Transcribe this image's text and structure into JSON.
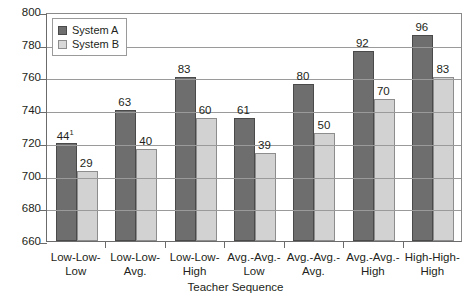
{
  "chart_data": {
    "type": "bar",
    "title": "",
    "xlabel": "Teacher Sequence",
    "ylabel": "",
    "ylim": [
      660,
      800
    ],
    "yticks": [
      660,
      680,
      700,
      720,
      740,
      760,
      780,
      800
    ],
    "grid": true,
    "legend_position": "top-left",
    "categories": [
      "Low-Low-Low",
      "Low-Low-Avg.",
      "Low-Low-High",
      "Avg.-Avg.-Low",
      "Avg.-Avg.-Avg.",
      "Avg.-Avg.-High",
      "High-High-High"
    ],
    "category_lines": [
      [
        "Low-Low-",
        "Low"
      ],
      [
        "Low-Low-",
        "Avg."
      ],
      [
        "Low-Low-",
        "High"
      ],
      [
        "Avg.-Avg.-",
        "Low"
      ],
      [
        "Avg.-Avg.-",
        "Avg."
      ],
      [
        "Avg.-Avg.-",
        "High"
      ],
      [
        "High-High-",
        "High"
      ]
    ],
    "series": [
      {
        "name": "System A",
        "color": "#6e6e6e",
        "values": [
          720,
          740,
          760,
          735,
          756,
          776,
          786
        ],
        "labels": [
          "44",
          "63",
          "83",
          "61",
          "80",
          "92",
          "96"
        ],
        "label_superscripts": [
          "1",
          "",
          "",
          "",
          "",
          "",
          ""
        ]
      },
      {
        "name": "System B",
        "color": "#d2d2d2",
        "values": [
          703,
          716,
          735,
          714,
          726,
          747,
          760
        ],
        "labels": [
          "29",
          "40",
          "60",
          "39",
          "50",
          "70",
          "83"
        ],
        "label_superscripts": [
          "",
          "",
          "",
          "",
          "",
          "",
          ""
        ]
      }
    ]
  },
  "legend": {
    "items": [
      {
        "label": "System A",
        "swatch": "dark-gray-swatch"
      },
      {
        "label": "System B",
        "swatch": "light-gray-swatch"
      }
    ]
  },
  "axis": {
    "y_tick_labels": [
      "800",
      "780",
      "760",
      "740",
      "720",
      "700",
      "680",
      "660"
    ],
    "x_title": "Teacher Sequence"
  }
}
